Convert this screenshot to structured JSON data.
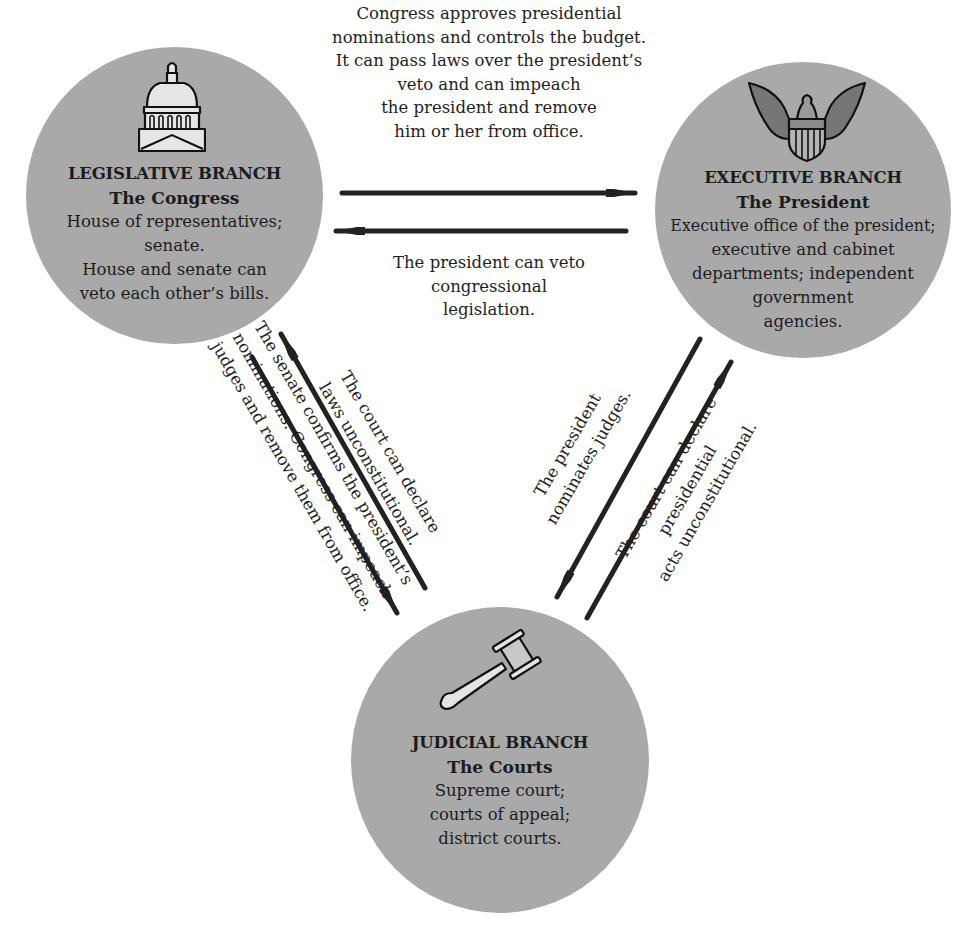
{
  "diagram": {
    "colors": {
      "circle_fill": "#a9a9a9",
      "arrow": "#222222",
      "text": "#1e1e1e",
      "background": "#ffffff"
    },
    "nodes": {
      "legislative": {
        "icon": "capitol-dome-icon",
        "title": "LEGISLATIVE BRANCH",
        "subtitle": "The Congress",
        "lines": [
          "House of representatives;",
          "senate.",
          "House and senate can",
          "veto each other’s bills."
        ]
      },
      "executive": {
        "icon": "eagle-seal-icon",
        "title": "EXECUTIVE BRANCH",
        "subtitle": "The President",
        "lines": [
          "Executive office of the president;",
          "executive and cabinet",
          "departments; independent",
          "government",
          "agencies."
        ]
      },
      "judicial": {
        "icon": "gavel-icon",
        "title": "JUDICIAL BRANCH",
        "subtitle": "The Courts",
        "lines": [
          "Supreme court;",
          "courts of appeal;",
          "district courts."
        ]
      }
    },
    "edges": {
      "legislative_to_executive": {
        "from": "legislative",
        "to": "executive",
        "lines": [
          "Congress approves presidential",
          "nominations and controls the budget.",
          "It can pass laws over the president’s",
          "veto and can impeach",
          "the president and remove",
          "him or her from office."
        ]
      },
      "executive_to_legislative": {
        "from": "executive",
        "to": "legislative",
        "lines": [
          "The president can veto",
          "congressional",
          "legislation."
        ]
      },
      "judicial_to_legislative": {
        "from": "judicial",
        "to": "legislative",
        "lines": [
          "The court can declare",
          "laws unconstitutional."
        ]
      },
      "legislative_to_judicial": {
        "from": "legislative",
        "to": "judicial",
        "lines": [
          "The senate confirms the president’s",
          "nominations. Congress can impeach",
          "judges and remove them from office."
        ]
      },
      "executive_to_judicial": {
        "from": "executive",
        "to": "judicial",
        "lines": [
          "The president",
          "nominates judges."
        ]
      },
      "judicial_to_executive": {
        "from": "judicial",
        "to": "executive",
        "lines": [
          "The court can declare",
          "presidential",
          "acts unconstitutional."
        ]
      }
    }
  }
}
